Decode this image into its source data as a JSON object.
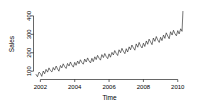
{
  "chart_data": {
    "type": "line",
    "title": "",
    "xlabel": "Time",
    "ylabel": "Sales",
    "xlim": [
      2001.6,
      2010.45
    ],
    "ylim": [
      55,
      440
    ],
    "grid": false,
    "legend": null,
    "xticks": [
      2002,
      2004,
      2006,
      2008,
      2010
    ],
    "xtick_labels": [
      "2002",
      "2004",
      "2006",
      "2008",
      "2010"
    ],
    "yticks": [
      100,
      200,
      300,
      400
    ],
    "ytick_labels": [
      "100",
      "200",
      "300",
      "400"
    ],
    "series": [
      {
        "name": "Sales",
        "color": "#1a1a1a",
        "x": [
          2001.75,
          2001.83,
          2001.92,
          2002.0,
          2002.08,
          2002.17,
          2002.25,
          2002.33,
          2002.42,
          2002.5,
          2002.58,
          2002.67,
          2002.75,
          2002.83,
          2002.92,
          2003.0,
          2003.08,
          2003.17,
          2003.25,
          2003.33,
          2003.42,
          2003.5,
          2003.58,
          2003.67,
          2003.75,
          2003.83,
          2003.92,
          2004.0,
          2004.08,
          2004.17,
          2004.25,
          2004.33,
          2004.42,
          2004.5,
          2004.58,
          2004.67,
          2004.75,
          2004.83,
          2004.92,
          2005.0,
          2005.08,
          2005.17,
          2005.25,
          2005.33,
          2005.42,
          2005.5,
          2005.58,
          2005.67,
          2005.75,
          2005.83,
          2005.92,
          2006.0,
          2006.08,
          2006.17,
          2006.25,
          2006.33,
          2006.42,
          2006.5,
          2006.58,
          2006.67,
          2006.75,
          2006.83,
          2006.92,
          2007.0,
          2007.08,
          2007.17,
          2007.25,
          2007.33,
          2007.42,
          2007.5,
          2007.58,
          2007.67,
          2007.75,
          2007.83,
          2007.92,
          2008.0,
          2008.08,
          2008.17,
          2008.25,
          2008.33,
          2008.42,
          2008.5,
          2008.58,
          2008.67,
          2008.75,
          2008.83,
          2008.92,
          2009.0,
          2009.08,
          2009.17,
          2009.25,
          2009.33,
          2009.42,
          2009.5,
          2009.58,
          2009.67,
          2009.75,
          2009.83,
          2009.92,
          2010.0,
          2010.08,
          2010.17,
          2010.25,
          2010.3
        ],
        "y": [
          82,
          70,
          95,
          88,
          72,
          101,
          86,
          110,
          95,
          118,
          104,
          96,
          120,
          106,
          128,
          112,
          100,
          131,
          118,
          140,
          124,
          115,
          142,
          128,
          150,
          134,
          122,
          148,
          132,
          155,
          140,
          162,
          146,
          138,
          166,
          150,
          172,
          156,
          145,
          170,
          152,
          178,
          163,
          186,
          170,
          160,
          190,
          174,
          196,
          180,
          168,
          194,
          176,
          202,
          188,
          212,
          196,
          185,
          216,
          200,
          224,
          208,
          195,
          222,
          204,
          232,
          216,
          242,
          226,
          214,
          248,
          230,
          256,
          238,
          226,
          252,
          234,
          264,
          246,
          274,
          258,
          244,
          280,
          262,
          288,
          270,
          256,
          284,
          266,
          296,
          278,
          308,
          290,
          276,
          314,
          296,
          322,
          304,
          292,
          320,
          302,
          330,
          316,
          424
        ]
      }
    ]
  }
}
